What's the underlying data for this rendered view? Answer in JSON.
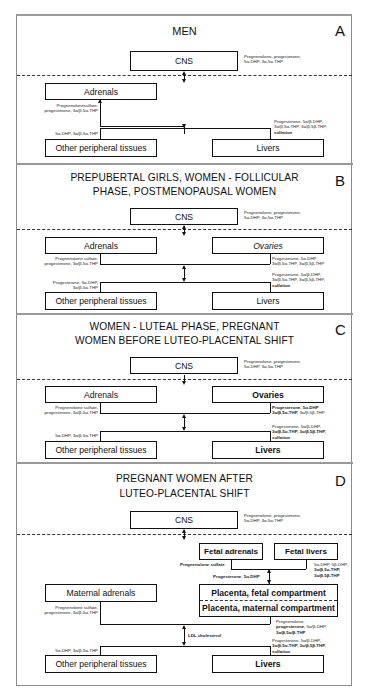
{
  "panels": {
    "A": {
      "letter": "A",
      "title_line1": "MEN",
      "title_line2": "",
      "cns": "CNS",
      "cns_note": [
        "Pregnenolone, progesterone,",
        "5α-DHP, 3α,5α-THP"
      ],
      "adrenals": "Adrenals",
      "adrenals_note": [
        "Pregnenolonesulfate,",
        "progesterone, 3α/β,5α-THP"
      ],
      "peripheral": "Other peripheral tissues",
      "peripheral_note": [
        "5α-DHP, 3α/β,5α-THP"
      ],
      "livers": "Livers",
      "livers_note": [
        "Progesterone, 5α/β-DHP,",
        "3α/β,5α-THP, 3α/β,5β-THP,",
        "sulfation"
      ]
    },
    "B": {
      "letter": "B",
      "title_line1": "PREPUBERTAL GIRLS, WOMEN - FOLLICULAR",
      "title_line2": "PHASE, POSTMENOPAUSAL WOMEN",
      "cns": "CNS",
      "cns_note": [
        "Pregnenolone, progesterone,",
        "5α-DHP, 3α,5α-THP"
      ],
      "adrenals": "Adrenals",
      "adrenals_note": [
        "Pregnenolone sulfate,",
        "progesterone, 3α/β,5α-THP"
      ],
      "ovaries": "Ovaries",
      "ovaries_note": [
        "Progesterone, 5α-DHP",
        "3α/β,5α-THP, 3α/β,5β-THP"
      ],
      "peripheral": "Other peripheral tissues",
      "peripheral_note": [
        "Progesterone, 5α-DHP,",
        "3α/β,5α-THP"
      ],
      "livers": "Livers",
      "livers_note": [
        "Progesterone, 5α/β-DHP,",
        "3α/β,5α-THP, 3α/β,5β-THP,",
        "sulfation"
      ]
    },
    "C": {
      "letter": "C",
      "title_line1": "WOMEN - LUTEAL PHASE, PREGNANT",
      "title_line2": "WOMEN BEFORE LUTEO-PLACENTAL SHIFT",
      "cns": "CNS",
      "cns_note": [
        "Pregnenolone, progesterone,",
        "5α-DHP, 3α,5α-THP"
      ],
      "adrenals": "Adrenals",
      "adrenals_note": [
        "Pregnenolone sulfate,",
        "progesterone, 3α/β,5α-THP"
      ],
      "ovaries": "Ovaries",
      "ovaries_note_bold1": "Progesterone, 5α-DHP",
      "ovaries_note_bold2": "3α/β,5α-THP,",
      "ovaries_note_plain2": " 3α/β,5β-THP",
      "peripheral": "Other peripheral tissues",
      "peripheral_note": [
        "5α-DHP, 3α/β,5α-THP"
      ],
      "livers": "Livers",
      "livers_note_plain1": "Progesterone, 5α/β-DHP,",
      "livers_note_bold2": "3α/β,5α-THP, 3α/β,5β-THP,",
      "livers_note_bold3": "sulfation"
    },
    "D": {
      "letter": "D",
      "title_line1": "PREGNANT WOMEN AFTER",
      "title_line2": "LUTEO-PLACENTAL SHIFT",
      "cns": "CNS",
      "cns_note": [
        "Pregnenolone, progesterone,",
        "5α-DHP, 3α,5α-THP"
      ],
      "fetal_adrenals": "Fetal adrenals",
      "fetal_livers": "Fetal livers",
      "fetal_adrenals_note": "Pregnenolone sulfate",
      "fetal_livers_note": [
        "5α-DHP, 5β-DHP,",
        "3α/β,5α-THP,",
        "3α/β,5β-THP"
      ],
      "fetal_to_placenta_note": "Progesterone, 5α-DHP",
      "maternal_adrenals": "Maternal adrenals",
      "maternal_adrenals_note": [
        "Pregnenolone sulfate,",
        "progesterone, 3α/β,5α-THP"
      ],
      "placenta_fetal": "Placenta, fetal compartment",
      "placenta_maternal": "Placenta, maternal compartment",
      "placenta_note_line1": "Pregnenolone,",
      "placenta_note_bold2": "progesterone,",
      "placenta_note_plain2": " 5α/β-DHP,",
      "placenta_note_bold3": "3α/β,5α/β-THP",
      "ldl_note": "LDL cholesterol",
      "peripheral": "Other peripheral tissues",
      "peripheral_note": [
        "5α-DHP, 3α/β,5α-THP"
      ],
      "livers": "Livers",
      "livers_note_plain1": "Progesterone, 5α/β-DHP,",
      "livers_note_bold2": "3α/β,5α-THP, 3α/β,5β-THP,",
      "livers_note_bold3": "sulfation"
    }
  }
}
